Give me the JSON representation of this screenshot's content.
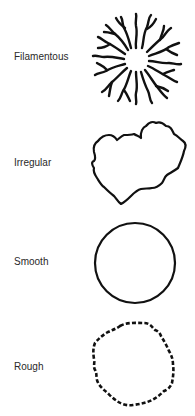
{
  "diagram": {
    "title": "",
    "rows": [
      {
        "label": "Filamentous",
        "shape": "filamentous-colony",
        "label_top": 51
      },
      {
        "label": "Irregular",
        "shape": "irregular-colony",
        "label_top": 157
      },
      {
        "label": "Smooth",
        "shape": "smooth-colony",
        "label_top": 256
      },
      {
        "label": "Rough",
        "shape": "rough-colony",
        "label_top": 361
      }
    ],
    "colors": {
      "stroke": "#111111",
      "label": "#2a2a2a",
      "background": "#ffffff"
    }
  }
}
